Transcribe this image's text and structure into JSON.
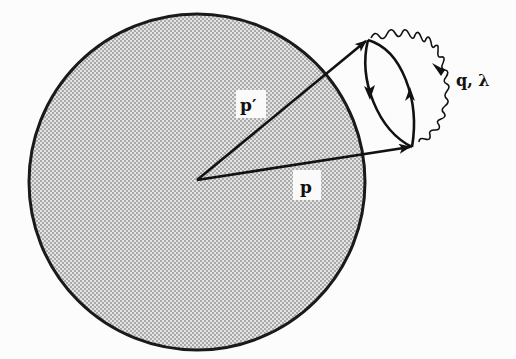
{
  "figure": {
    "sphere": {
      "fill_pattern": "halftone-dots",
      "fill_color": "#c9c9c9",
      "stroke_color": "#1a1a1a"
    },
    "labels": {
      "p_prime": "p′",
      "p": "p",
      "photon": "q, λ"
    },
    "colors": {
      "ink": "#111111",
      "paper": "#fcfcfc",
      "bleed_through": "#d8d8d8"
    }
  }
}
